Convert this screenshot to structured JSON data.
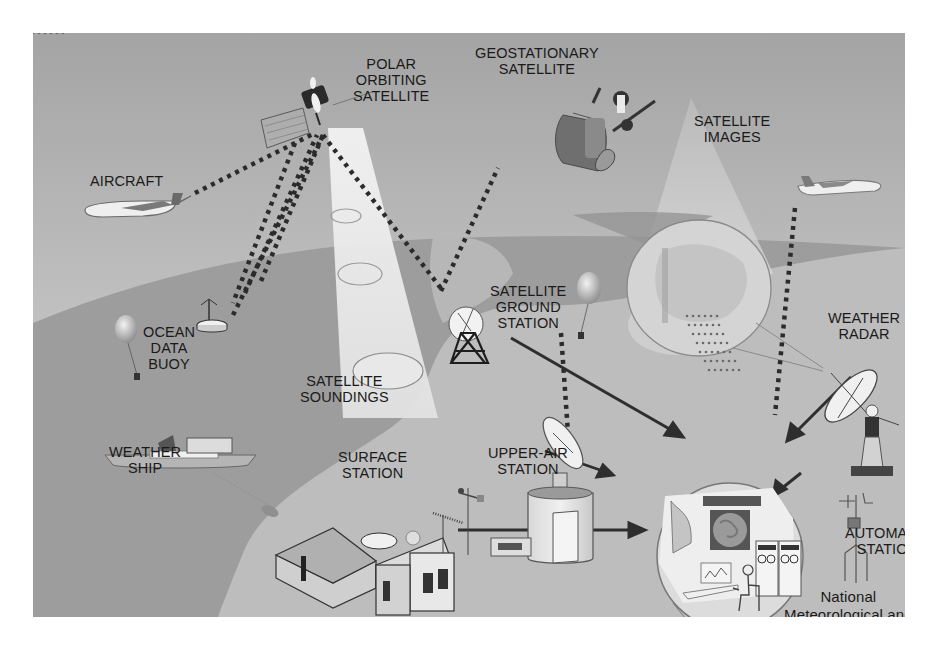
{
  "diagram": {
    "colors": {
      "sky_top": "#a6a6a6",
      "sky_bottom": "#d2d2d2",
      "ocean": "#9b9b9b",
      "land": "#bcbcbc",
      "beam": "#e6e6e6",
      "ink": "#1a1a1a",
      "link_dots": "#2a2a2a",
      "arrows": "#333333"
    },
    "labels": {
      "polar_satellite": "POLAR\nORBITING\nSATELLITE",
      "geostationary_satellite": "GEOSTATIONARY\nSATELLITE",
      "satellite_images": "SATELLITE\nIMAGES",
      "aircraft": "AIRCRAFT",
      "ocean_data_buoy": "OCEAN\nDATA\nBUOY",
      "satellite_soundings": "SATELLITE\nSOUNDINGS",
      "satellite_ground_station": "SATELLITE\nGROUND\nSTATION",
      "weather_radar": "WEATHER\nRADAR",
      "weather_ship": "WEATHER\nSHIP",
      "upper_air_station": "UPPER-AIR\nSTATION",
      "surface_station": "SURFACE\nSTATION",
      "automatic_station": "AUTOMATIC\nSTATION",
      "nmhs": "National\nMeteorological and\nHydrological Service"
    },
    "nodes": [
      {
        "id": "polar_satellite",
        "label": "POLAR ORBITING SATELLITE"
      },
      {
        "id": "geostationary_satellite",
        "label": "GEOSTATIONARY SATELLITE"
      },
      {
        "id": "aircraft_left",
        "label": "AIRCRAFT"
      },
      {
        "id": "aircraft_right",
        "label": ""
      },
      {
        "id": "ocean_data_buoy",
        "label": "OCEAN DATA BUOY"
      },
      {
        "id": "weather_ship",
        "label": "WEATHER SHIP"
      },
      {
        "id": "satellite_ground_station",
        "label": "SATELLITE GROUND STATION"
      },
      {
        "id": "upper_air_station",
        "label": "UPPER-AIR STATION"
      },
      {
        "id": "surface_station",
        "label": "SURFACE STATION"
      },
      {
        "id": "weather_radar",
        "label": "WEATHER RADAR"
      },
      {
        "id": "automatic_station",
        "label": "AUTOMATIC STATION"
      },
      {
        "id": "nmhs",
        "label": "National Meteorological and Hydrological Service"
      }
    ],
    "links": [
      {
        "from": "aircraft_left",
        "to": "polar_satellite",
        "style": "dotted"
      },
      {
        "from": "ocean_data_buoy",
        "to": "polar_satellite",
        "style": "dotted"
      },
      {
        "from": "weather_ship",
        "to": "polar_satellite",
        "style": "dotted"
      },
      {
        "from": "satellite_ground_station",
        "to": "polar_satellite",
        "style": "dotted"
      },
      {
        "from": "satellite_ground_station",
        "to": "geostationary_satellite",
        "style": "dotted"
      },
      {
        "from": "upper_air_station",
        "to": "radiosonde_balloon",
        "style": "dotted"
      },
      {
        "from": "nmhs",
        "to": "aircraft_right",
        "style": "dotted"
      },
      {
        "from": "satellite_ground_station",
        "to": "nmhs",
        "style": "arrow"
      },
      {
        "from": "upper_air_station",
        "to": "nmhs",
        "style": "arrow"
      },
      {
        "from": "surface_station",
        "to": "nmhs",
        "style": "arrow"
      },
      {
        "from": "weather_radar",
        "to": "nmhs",
        "style": "arrow"
      },
      {
        "from": "automatic_station",
        "to": "nmhs",
        "style": "arrow"
      }
    ]
  }
}
